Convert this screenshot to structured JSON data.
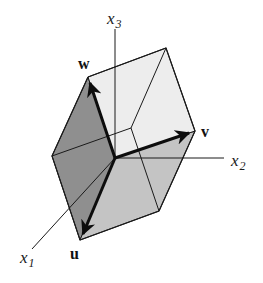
{
  "figure": {
    "title": "",
    "axes": {
      "x1": {
        "label": "x",
        "subscript": "1"
      },
      "x2": {
        "label": "x",
        "subscript": "2"
      },
      "x3": {
        "label": "x",
        "subscript": "3"
      }
    },
    "vectors": {
      "u": {
        "label": "u"
      },
      "v": {
        "label": "v"
      },
      "w": {
        "label": "w"
      }
    },
    "colors": {
      "left_face": "#8f8f8f",
      "bottom_face": "#c4c4c4",
      "top_face": "#ececec",
      "right_face": "#f3f3f3",
      "edge": "#1a1a1a",
      "vector": "#0d0d0d"
    }
  }
}
